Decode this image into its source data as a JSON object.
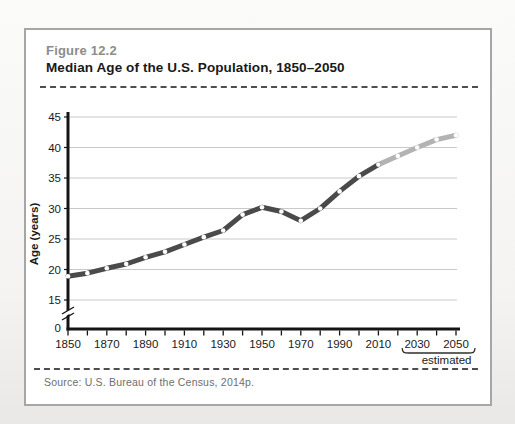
{
  "figure": {
    "label": "Figure 12.2",
    "title": "Median Age of the U.S. Population, 1850–2050",
    "source": "Source: U.S. Bureau of the Census, 2014p."
  },
  "chart_data": {
    "type": "line",
    "title": "Median Age of the U.S. Population, 1850–2050",
    "xlabel": "",
    "ylabel": "Age (years)",
    "x": [
      1850,
      1860,
      1870,
      1880,
      1890,
      1900,
      1910,
      1920,
      1930,
      1940,
      1950,
      1960,
      1970,
      1980,
      1990,
      2000,
      2010,
      2020,
      2030,
      2040,
      2050
    ],
    "series": [
      {
        "name": "Median age",
        "values": [
          18.9,
          19.4,
          20.2,
          20.9,
          22.0,
          22.9,
          24.1,
          25.3,
          26.4,
          29.0,
          30.2,
          29.5,
          28.0,
          30.0,
          32.8,
          35.3,
          37.2,
          38.6,
          40.0,
          41.3,
          42.0
        ]
      }
    ],
    "x_tick_labels": [
      "1850",
      "1870",
      "1890",
      "1910",
      "1930",
      "1950",
      "1970",
      "1990",
      "2010",
      "2030",
      "2050"
    ],
    "y_ticks": [
      0,
      15,
      20,
      25,
      30,
      35,
      40,
      45
    ],
    "ylim": [
      0,
      45
    ],
    "axis_break_between": [
      0,
      15
    ],
    "grid": true,
    "legend": "none",
    "estimated": {
      "from_year": 2010,
      "bracket_years": [
        2030,
        2050
      ],
      "label": "estimated"
    },
    "colors": {
      "line": "#4a4a4a",
      "estimated_line": "#b3b3b3",
      "marker": "#ffffff",
      "grid": "#c9c9c9",
      "axis": "#141414",
      "bracket": "#2e2e2e"
    }
  }
}
